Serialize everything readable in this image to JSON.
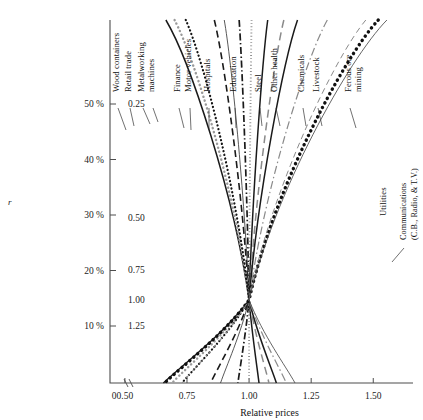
{
  "chart_data": {
    "type": "line",
    "title": "",
    "xlabel": "Relative prices",
    "ylabel": "r",
    "xlim": [
      0.44,
      1.66
    ],
    "ylim": [
      0.0,
      0.06
    ],
    "grid": false,
    "legend_position": "inline-curve-labels",
    "x_ticks": [
      "0",
      "0.50",
      "0.75",
      "1.00",
      "1.25",
      "1.50"
    ],
    "x_tick_values": [
      0.45,
      0.5,
      0.75,
      1.0,
      1.25,
      1.5
    ],
    "x_axis_break": true,
    "y_ticks_left": [
      "50 %",
      "40 %",
      "30 %",
      "20 %",
      "10 %"
    ],
    "y_tick_values_left": [
      0.5,
      0.4,
      0.3,
      0.2,
      0.1
    ],
    "y_ticks_right": [
      "0.25",
      "0.50",
      "0.75",
      "1.00",
      "1.25"
    ],
    "y_tick_right_unticked": [
      "1.00"
    ],
    "convergence_point": [
      1.0,
      1.0
    ],
    "annotations": [
      "All curves converge at relative price 1.00 and wage-profit value 1.00"
    ],
    "series": [
      {
        "name": "Wood containers",
        "style": "solid-thick",
        "color": "#1a1a1a",
        "top_x": 0.665,
        "bottom_x": 0.655
      },
      {
        "name": "Retail trade",
        "style": "dotted-gray-round",
        "color": "#9a9a9a",
        "top_x": 0.7,
        "bottom_x": 0.69
      },
      {
        "name": "Metalworking machines",
        "style": "dotted-black",
        "color": "#151515",
        "top_x": 0.745,
        "bottom_x": 0.73
      },
      {
        "name": "Finance",
        "style": "dashed-long",
        "color": "#1a1a1a",
        "top_x": 0.86,
        "bottom_x": 0.845
      },
      {
        "name": "Motor vehicles",
        "style": "solid-thin",
        "color": "#3a3a3a",
        "top_x": 0.9,
        "bottom_x": 0.885
      },
      {
        "name": "Hospitals",
        "style": "dash-dot",
        "color": "#1a1a1a",
        "top_x": 0.96,
        "bottom_x": 0.955
      },
      {
        "name": "Education",
        "style": "dotted-gray-sq",
        "color": "#8e8e8e",
        "top_x": 1.01,
        "bottom_x": 1.0
      },
      {
        "name": "Steel",
        "style": "solid-thick",
        "color": "#1a1a1a",
        "top_x": 1.075,
        "bottom_x": 1.04
      },
      {
        "name": "Other health",
        "style": "dashed-gray",
        "color": "#8a8a8a",
        "top_x": 1.14,
        "bottom_x": 1.08
      },
      {
        "name": "Chemicals",
        "style": "solid-thick",
        "color": "#1a1a1a",
        "top_x": 1.195,
        "bottom_x": 1.11
      },
      {
        "name": "Livestock",
        "style": "dash-dot-gray",
        "color": "#8a8a8a",
        "top_x": 1.315,
        "bottom_x": 1.15
      },
      {
        "name": "Utilities",
        "style": "dots-big",
        "color": "#101010",
        "top_x": 1.52,
        "bottom_x": 0.66
      },
      {
        "name": "Ferous ore mining",
        "style": "dashed-gray-thin",
        "color": "#8a8a8a",
        "top_x": 1.47,
        "bottom_x": 0.73
      },
      {
        "name": "Communications (C.B., Radio, & T.V.)",
        "style": "solid-thin",
        "color": "#4a4a4a",
        "top_x": 1.555,
        "bottom_x": 1.185
      }
    ]
  },
  "labels": {
    "wood_containers": "Wood containers",
    "retail_trade": "Retail trade",
    "metalworking_1": "Metalworking",
    "metalworking_2": "machines",
    "finance": "Finance",
    "motor_vehicles": "Motor vehicles",
    "hospitals": "Hospitals",
    "education": "Education",
    "steel": "Steel",
    "other_health": "Other health",
    "chemicals": "Chemicals",
    "livestock": "Livestock",
    "ferous_1": "Ferous ore",
    "ferous_2": "mining",
    "utilities": "Utilities",
    "comms_1": "Communications",
    "comms_2": "(C.B., Radio, & T.V.)"
  },
  "axes": {
    "x_title": "Relative prices",
    "y_title": "r",
    "x_ticks": [
      "0",
      "0.50",
      "0.75",
      "1.00",
      "1.25",
      "1.50"
    ],
    "y_left": [
      "50 %",
      "40 %",
      "30 %",
      "20 %",
      "10 %"
    ],
    "y_right": [
      "0.25",
      "0.50",
      "0.75",
      "1.00",
      "1.25"
    ]
  }
}
